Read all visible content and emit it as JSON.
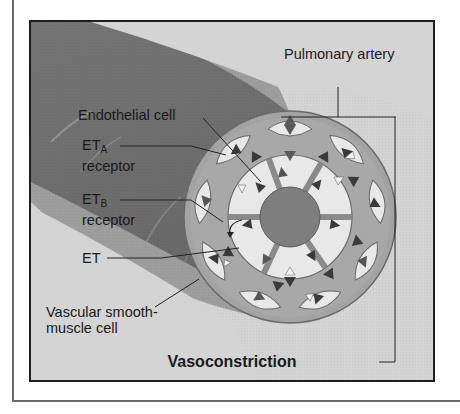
{
  "figure": {
    "title": "Vasoconstriction",
    "labels": {
      "pulmonary_artery": "Pulmonary artery",
      "endothelial_cell": "Endothelial cell",
      "et_a_main": "ET",
      "et_a_sub": "A",
      "et_a_suffix": "receptor",
      "et_b_main": "ET",
      "et_b_sub": "B",
      "et_b_suffix": "receptor",
      "et": "ET",
      "smooth_muscle_line1": "Vascular smooth-",
      "smooth_muscle_line2": "muscle cell"
    },
    "colors": {
      "background": "#d4d4d4",
      "vessel_wall": "#7a7a7a",
      "outer_ring": "#9c9c9c",
      "cell_fill": "#e6e6e6",
      "lumen": "#808080",
      "receptor_dark": "#3a3a3a",
      "receptor_light": "#f2f2f2"
    }
  }
}
